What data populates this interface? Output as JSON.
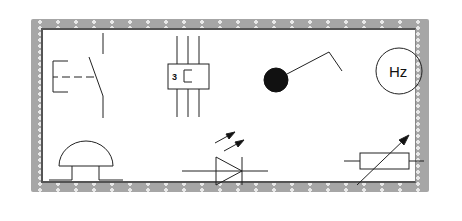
{
  "diagram": {
    "title": "",
    "symbols": [
      {
        "id": "switch",
        "name": "Manually operated switch (push-button, normally open)"
      },
      {
        "id": "thermal-relay",
        "name": "Three-phase thermal overload relay",
        "label": "3"
      },
      {
        "id": "indicator",
        "name": "Ball/float switch or indicator"
      },
      {
        "id": "frequency-meter",
        "name": "Frequency meter",
        "label": "Hz"
      },
      {
        "id": "bell",
        "name": "Electric bell / buzzer"
      },
      {
        "id": "photodiode",
        "name": "Photodiode (light-receiving diode)"
      },
      {
        "id": "variable-resistor",
        "name": "Variable resistor (rheostat)"
      }
    ]
  },
  "colors": {
    "frame": "#a6a6a6",
    "frame_dot": "#e8e8e8",
    "inner_border": "#555555",
    "stroke": "#222222",
    "background": "#ffffff"
  }
}
